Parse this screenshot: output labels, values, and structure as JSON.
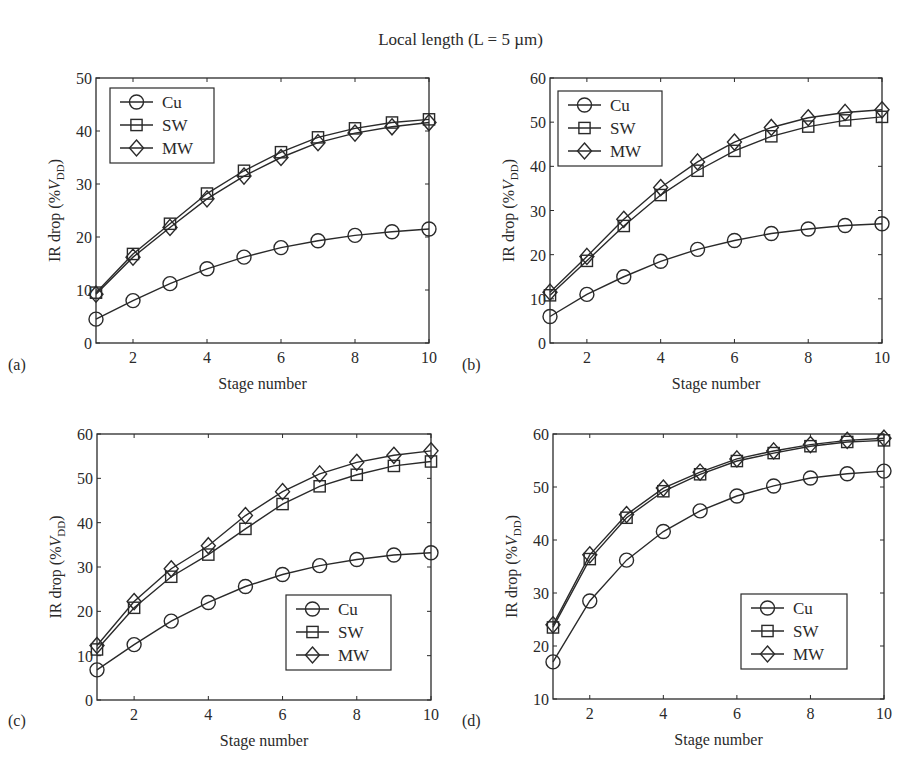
{
  "figure_title": "Local length (L = 5 µm)",
  "chart_data": [
    {
      "panel": "(a)",
      "type": "line",
      "title": "",
      "xlabel": "Stage number",
      "ylabel": "IR drop (%V_DD)",
      "x": [
        1,
        2,
        3,
        4,
        5,
        6,
        7,
        8,
        9,
        10
      ],
      "xticks": [
        2,
        4,
        6,
        8,
        10
      ],
      "xlim": [
        1,
        10
      ],
      "ylim": [
        0,
        50
      ],
      "yticks": [
        0,
        10,
        20,
        30,
        40,
        50
      ],
      "grid": false,
      "legend_position": "upper left",
      "series": [
        {
          "name": "Cu",
          "marker": "circle",
          "values": [
            4.5,
            8.0,
            11.2,
            14.0,
            16.2,
            18.0,
            19.3,
            20.3,
            21.0,
            21.5
          ]
        },
        {
          "name": "SW",
          "marker": "square",
          "values": [
            9.5,
            16.8,
            22.5,
            28.2,
            32.5,
            36.0,
            38.8,
            40.5,
            41.6,
            42.2
          ]
        },
        {
          "name": "MW",
          "marker": "diamond",
          "values": [
            9.2,
            16.2,
            21.8,
            27.2,
            31.5,
            35.0,
            37.8,
            39.6,
            40.8,
            41.6
          ]
        }
      ]
    },
    {
      "panel": "(b)",
      "type": "line",
      "title": "",
      "xlabel": "Stage number",
      "ylabel": "IR drop (%V_DD)",
      "x": [
        1,
        2,
        3,
        4,
        5,
        6,
        7,
        8,
        9,
        10
      ],
      "xticks": [
        2,
        4,
        6,
        8,
        10
      ],
      "xlim": [
        1,
        10
      ],
      "ylim": [
        0,
        60
      ],
      "yticks": [
        0,
        10,
        20,
        30,
        40,
        50,
        60
      ],
      "grid": false,
      "legend_position": "upper left",
      "series": [
        {
          "name": "Cu",
          "marker": "circle",
          "values": [
            6.0,
            11.0,
            15.0,
            18.5,
            21.2,
            23.2,
            24.8,
            25.8,
            26.6,
            27.0
          ]
        },
        {
          "name": "SW",
          "marker": "square",
          "values": [
            10.8,
            18.6,
            26.5,
            33.5,
            39.0,
            43.5,
            46.8,
            49.0,
            50.4,
            51.2
          ]
        },
        {
          "name": "MW",
          "marker": "diamond",
          "values": [
            11.5,
            19.6,
            28.0,
            35.2,
            41.0,
            45.5,
            48.8,
            51.0,
            52.2,
            52.8
          ]
        }
      ]
    },
    {
      "panel": "(c)",
      "type": "line",
      "title": "",
      "xlabel": "Stage number",
      "ylabel": "IR drop (%V_DD)",
      "x": [
        1,
        2,
        3,
        4,
        5,
        6,
        7,
        8,
        9,
        10
      ],
      "xticks": [
        2,
        4,
        6,
        8,
        10
      ],
      "xlim": [
        1,
        10
      ],
      "ylim": [
        0,
        60
      ],
      "yticks": [
        0,
        10,
        20,
        30,
        40,
        50,
        60
      ],
      "grid": false,
      "legend_position": "lower right",
      "series": [
        {
          "name": "Cu",
          "marker": "circle",
          "values": [
            6.8,
            12.5,
            17.8,
            22.0,
            25.6,
            28.3,
            30.3,
            31.7,
            32.7,
            33.2
          ]
        },
        {
          "name": "SW",
          "marker": "square",
          "values": [
            11.4,
            20.8,
            27.8,
            32.8,
            38.6,
            44.2,
            48.2,
            50.8,
            52.8,
            53.8
          ]
        },
        {
          "name": "MW",
          "marker": "diamond",
          "values": [
            12.3,
            22.2,
            29.6,
            34.8,
            41.6,
            47.0,
            51.0,
            53.6,
            55.2,
            56.2
          ]
        }
      ]
    },
    {
      "panel": "(d)",
      "type": "line",
      "title": "",
      "xlabel": "Stage number",
      "ylabel": "IR drop (%V_DD)",
      "x": [
        1,
        2,
        3,
        4,
        5,
        6,
        7,
        8,
        9,
        10
      ],
      "xticks": [
        2,
        4,
        6,
        8,
        10
      ],
      "xlim": [
        1,
        10
      ],
      "ylim": [
        10,
        60
      ],
      "yticks": [
        10,
        20,
        30,
        40,
        50,
        60
      ],
      "grid": false,
      "legend_position": "lower right",
      "series": [
        {
          "name": "Cu",
          "marker": "circle",
          "values": [
            17.0,
            28.5,
            36.2,
            41.6,
            45.5,
            48.3,
            50.2,
            51.7,
            52.5,
            53.0
          ]
        },
        {
          "name": "SW",
          "marker": "square",
          "values": [
            23.5,
            36.4,
            44.2,
            49.2,
            52.4,
            54.9,
            56.4,
            57.7,
            58.5,
            58.8
          ]
        },
        {
          "name": "MW",
          "marker": "diamond",
          "values": [
            24.0,
            37.2,
            44.8,
            49.8,
            52.8,
            55.3,
            56.8,
            58.0,
            58.8,
            59.2
          ]
        }
      ]
    }
  ],
  "layout": {
    "panels": [
      {
        "left": 96,
        "top": 78,
        "right": 429,
        "bottom": 343,
        "label_x": 8,
        "label_y": 370
      },
      {
        "left": 550,
        "top": 78,
        "right": 882,
        "bottom": 343,
        "label_x": 462,
        "label_y": 370
      },
      {
        "left": 97,
        "top": 434,
        "right": 431,
        "bottom": 700,
        "label_x": 8,
        "label_y": 726
      },
      {
        "left": 553,
        "top": 434,
        "right": 884,
        "bottom": 699,
        "label_x": 462,
        "label_y": 726
      }
    ],
    "legend_boxes": [
      {
        "x": 110,
        "y": 88,
        "w": 104,
        "h": 75
      },
      {
        "x": 558,
        "y": 91,
        "w": 104,
        "h": 75
      },
      {
        "x": 286,
        "y": 595,
        "w": 105,
        "h": 75
      },
      {
        "x": 741,
        "y": 594,
        "w": 106,
        "h": 75
      }
    ],
    "line_color": "#2a2a2a"
  }
}
